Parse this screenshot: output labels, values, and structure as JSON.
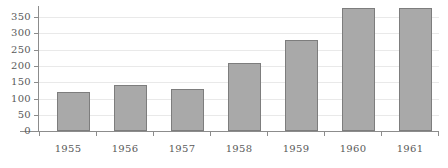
{
  "chart_data": {
    "type": "bar",
    "title": "",
    "subtitle": "",
    "xlabel": "",
    "ylabel": "",
    "categories": [
      "1955",
      "1956",
      "1957",
      "1958",
      "1959",
      "1960",
      "1961"
    ],
    "values": [
      85,
      120,
      140,
      130,
      210,
      280,
      378
    ],
    "series": [
      {
        "name": "",
        "values": [
          85,
          120,
          140,
          130,
          210,
          280,
          378
        ]
      }
    ],
    "ylim": [
      0,
      380
    ],
    "xlim": [
      0,
      7
    ],
    "y_ticks": [
      0,
      50,
      100,
      150,
      200,
      250,
      300,
      350
    ],
    "y_tick_labels": [
      "0",
      "50",
      "100",
      "150",
      "200",
      "250",
      "300",
      "350"
    ],
    "x_tick_labels": [
      "1955",
      "1956",
      "1957",
      "1958",
      "1959",
      "1960",
      "1961"
    ],
    "grid": true,
    "grid_axis": "y",
    "legend": false,
    "legend_position": "none",
    "annotations": [],
    "colors": {
      "bar_fill": "#a9a9a9",
      "bar_edge": "#7d7d7d",
      "gridline": "#e9e9e9",
      "axis": "#8c8c8c",
      "tick_label": "#5a5a5a",
      "background": "#ffffff"
    }
  }
}
